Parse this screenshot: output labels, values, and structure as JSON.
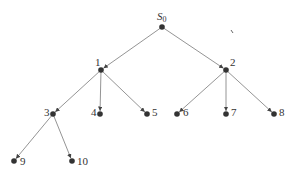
{
  "diagram": {
    "type": "tree",
    "root_label": "S",
    "root_subscript": "0",
    "nodes": [
      {
        "id": "S0",
        "label": "S",
        "sub": "0",
        "x": 162,
        "y": 27,
        "lx": 157,
        "ly": 20
      },
      {
        "id": "1",
        "label": "1",
        "x": 101,
        "y": 70,
        "lx": 95,
        "ly": 66
      },
      {
        "id": "2",
        "label": "2",
        "x": 226,
        "y": 70,
        "lx": 230,
        "ly": 66
      },
      {
        "id": "3",
        "label": "3",
        "x": 53,
        "y": 114,
        "lx": 44,
        "ly": 116
      },
      {
        "id": "4",
        "label": "4",
        "x": 100,
        "y": 114,
        "lx": 91,
        "ly": 116
      },
      {
        "id": "5",
        "label": "5",
        "x": 147,
        "y": 114,
        "lx": 152,
        "ly": 116
      },
      {
        "id": "6",
        "label": "6",
        "x": 177,
        "y": 114,
        "lx": 183,
        "ly": 116
      },
      {
        "id": "7",
        "label": "7",
        "x": 226,
        "y": 114,
        "lx": 231,
        "ly": 116
      },
      {
        "id": "8",
        "label": "8",
        "x": 274,
        "y": 114,
        "lx": 279,
        "ly": 116
      },
      {
        "id": "9",
        "label": "9",
        "x": 14,
        "y": 161,
        "lx": 20,
        "ly": 165
      },
      {
        "id": "10",
        "label": "10",
        "x": 72,
        "y": 161,
        "lx": 77,
        "ly": 165
      }
    ],
    "edges": [
      [
        "S0",
        "1"
      ],
      [
        "S0",
        "2"
      ],
      [
        "1",
        "3"
      ],
      [
        "1",
        "4"
      ],
      [
        "1",
        "5"
      ],
      [
        "2",
        "6"
      ],
      [
        "2",
        "7"
      ],
      [
        "2",
        "8"
      ],
      [
        "3",
        "9"
      ],
      [
        "3",
        "10"
      ]
    ],
    "colors": {
      "node": "#333333",
      "edge": "#888888",
      "label": "#333333"
    }
  }
}
